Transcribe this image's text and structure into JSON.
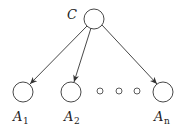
{
  "diagram": {
    "root": {
      "label": "C",
      "cx": 94,
      "cy": 19,
      "r": 10
    },
    "children": [
      {
        "label": "A",
        "sub": "1",
        "cx": 23,
        "cy": 92,
        "r": 10
      },
      {
        "label": "A",
        "sub": "2",
        "cx": 71,
        "cy": 92,
        "r": 10
      },
      {
        "label": "A",
        "sub": "n",
        "cx": 163,
        "cy": 92,
        "r": 10
      }
    ],
    "ellipsis_dots": [
      {
        "cx": 100,
        "cy": 91,
        "r": 3
      },
      {
        "cx": 119,
        "cy": 91,
        "r": 3
      },
      {
        "cx": 137,
        "cy": 91,
        "r": 3
      }
    ],
    "colors": {
      "stroke": "#333333",
      "background": "#ffffff"
    }
  }
}
